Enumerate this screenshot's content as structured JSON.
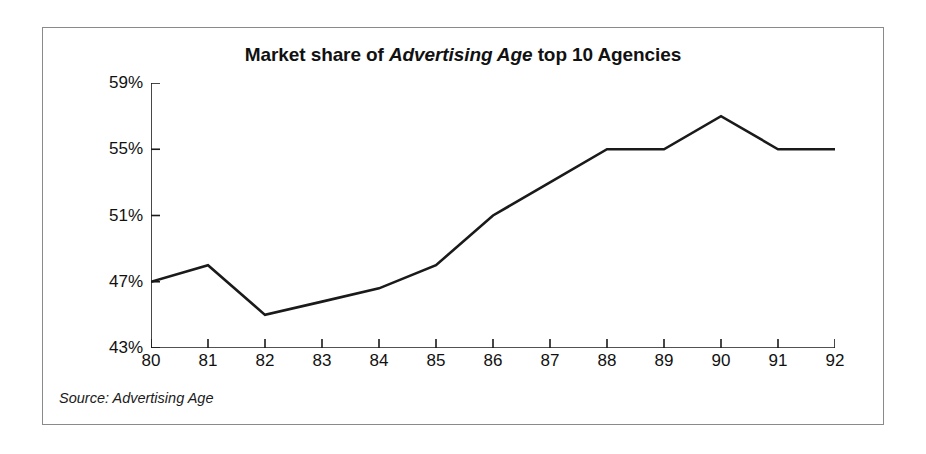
{
  "figure": {
    "title_prefix": "Market share of ",
    "title_emphasis": "Advertising Age",
    "title_suffix": " top 10 Agencies",
    "title_full": "Market share of Advertising Age top 10 Agencies",
    "source_note": "Source: Advertising Age",
    "border_color": "#8a8a8a",
    "background_color": "#ffffff"
  },
  "chart_data": {
    "type": "line",
    "title": "Market share of Advertising Age top 10 Agencies",
    "xlabel": "",
    "ylabel": "",
    "categories": [
      "80",
      "81",
      "82",
      "83",
      "84",
      "85",
      "86",
      "87",
      "88",
      "89",
      "90",
      "91",
      "92"
    ],
    "x": [
      80,
      81,
      82,
      83,
      84,
      85,
      86,
      87,
      88,
      89,
      90,
      91,
      92
    ],
    "values": [
      47,
      48,
      45,
      45.8,
      46.6,
      48,
      51,
      53,
      55,
      55,
      57,
      55,
      55
    ],
    "value_unit": "%",
    "ylim": [
      43,
      59
    ],
    "yticks": [
      43,
      47,
      51,
      55,
      59
    ],
    "ytick_labels": [
      "43%",
      "47%",
      "51%",
      "55%",
      "59%"
    ],
    "xticks": [
      80,
      81,
      82,
      83,
      84,
      85,
      86,
      87,
      88,
      89,
      90,
      91,
      92
    ],
    "xtick_labels": [
      "80",
      "81",
      "82",
      "83",
      "84",
      "85",
      "86",
      "87",
      "88",
      "89",
      "90",
      "91",
      "92"
    ],
    "grid": false,
    "legend": false,
    "series": [
      {
        "name": "Top 10 agencies market share",
        "color": "#1a1a1a",
        "line_width": 2.6,
        "markers": false,
        "values": [
          47,
          48,
          45,
          45.8,
          46.6,
          48,
          51,
          53,
          55,
          55,
          57,
          55,
          55
        ]
      }
    ],
    "annotations": [
      "Source: Advertising Age"
    ]
  }
}
